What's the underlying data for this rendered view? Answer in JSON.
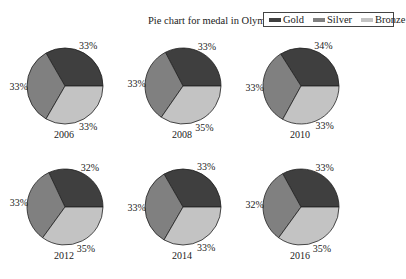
{
  "chart_data": {
    "type": "pie",
    "title": "Pie chart for medal in Olympics",
    "legend": {
      "position": "upper right",
      "entries": [
        "Gold",
        "Silver",
        "Bronze"
      ]
    },
    "colors": {
      "Gold": "#3f3f3f",
      "Silver": "#808080",
      "Bronze": "#c3c3c3"
    },
    "categories": [
      "Gold",
      "Silver",
      "Bronze"
    ],
    "pies": [
      {
        "label": "2006",
        "values": [
          33,
          33,
          33
        ]
      },
      {
        "label": "2008",
        "values": [
          33,
          33,
          35
        ]
      },
      {
        "label": "2010",
        "values": [
          34,
          33,
          33
        ]
      },
      {
        "label": "2012",
        "values": [
          32,
          33,
          35
        ]
      },
      {
        "label": "2014",
        "values": [
          33,
          33,
          33
        ]
      },
      {
        "label": "2016",
        "values": [
          33,
          32,
          35
        ]
      }
    ],
    "layout": {
      "rows": 2,
      "cols": 3
    },
    "startangle": 0,
    "counterclock": true
  },
  "title": "Pie chart for medal in Olympics",
  "legend": {
    "items": [
      {
        "label": "Gold",
        "color": "#3f3f3f"
      },
      {
        "label": "Silver",
        "color": "#808080"
      },
      {
        "label": "Bronze",
        "color": "#c3c3c3"
      }
    ]
  }
}
